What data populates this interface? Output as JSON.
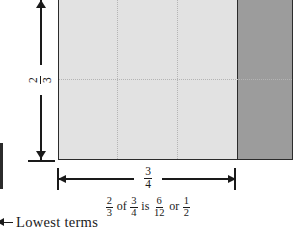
{
  "figure": {
    "colors": {
      "light_region": "#e2e2e2",
      "dark_region": "#9c9c9c",
      "outline": "#2b2b2b",
      "grid": "#b4b4b4",
      "ink": "#1a1a1a",
      "background": "#ffffff"
    }
  },
  "vertical_dimension": {
    "name": "two-thirds",
    "numerator": "2",
    "denominator": "3",
    "orientation": "vertical",
    "rotation_degrees": -90
  },
  "horizontal_dimension": {
    "name": "three-fourths",
    "numerator": "3",
    "denominator": "4",
    "orientation": "horizontal"
  },
  "caption": {
    "frac_a": {
      "numerator": "2",
      "denominator": "3"
    },
    "word_of": "of",
    "frac_b": {
      "numerator": "3",
      "denominator": "4"
    },
    "word_is": "is",
    "frac_c": {
      "numerator": "6",
      "denominator": "12"
    },
    "word_or": "or",
    "frac_d": {
      "numerator": "1",
      "denominator": "2"
    },
    "plain_text": "2/3 of 3/4 is 6/12 or 1/2"
  },
  "annotation": {
    "arrow_icon": "arrow-left-icon",
    "label": "Lowest terms"
  },
  "grid": {
    "vertical_divider_count": 2,
    "horizontal_divider_count": 1,
    "total_cells": 12,
    "shaded_cells": 6
  }
}
